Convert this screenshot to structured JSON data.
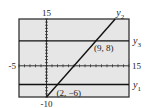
{
  "chart_data": {
    "type": "line",
    "title": "",
    "xlabel": "",
    "ylabel": "",
    "xlim": [
      -5,
      15
    ],
    "ylim": [
      -10,
      15
    ],
    "grid": false,
    "window_labels": {
      "xmin": "-5",
      "xmax": "15",
      "ymin": "-10",
      "ymax": "15"
    },
    "series": [
      {
        "name": "y1",
        "label": "y",
        "subscript": "1",
        "equation": "y = -6",
        "x": [
          -5,
          15
        ],
        "y": [
          -6,
          -6
        ]
      },
      {
        "name": "y2",
        "label": "y",
        "subscript": "2",
        "equation": "y = 2x - 10",
        "x": [
          0,
          12.5
        ],
        "y": [
          -10,
          15
        ]
      },
      {
        "name": "y3",
        "label": "y",
        "subscript": "3",
        "equation": "y = 8",
        "x": [
          -5,
          15
        ],
        "y": [
          8,
          8
        ]
      }
    ],
    "annotations": [
      {
        "text": "(9, 8)",
        "x": 9,
        "y": 8
      },
      {
        "text": "(2, −6)",
        "x": 2,
        "y": -6
      }
    ]
  },
  "colors": {
    "frame": "#333333",
    "background": "#e6e6e6",
    "line": "#111111",
    "text": "#222222"
  }
}
